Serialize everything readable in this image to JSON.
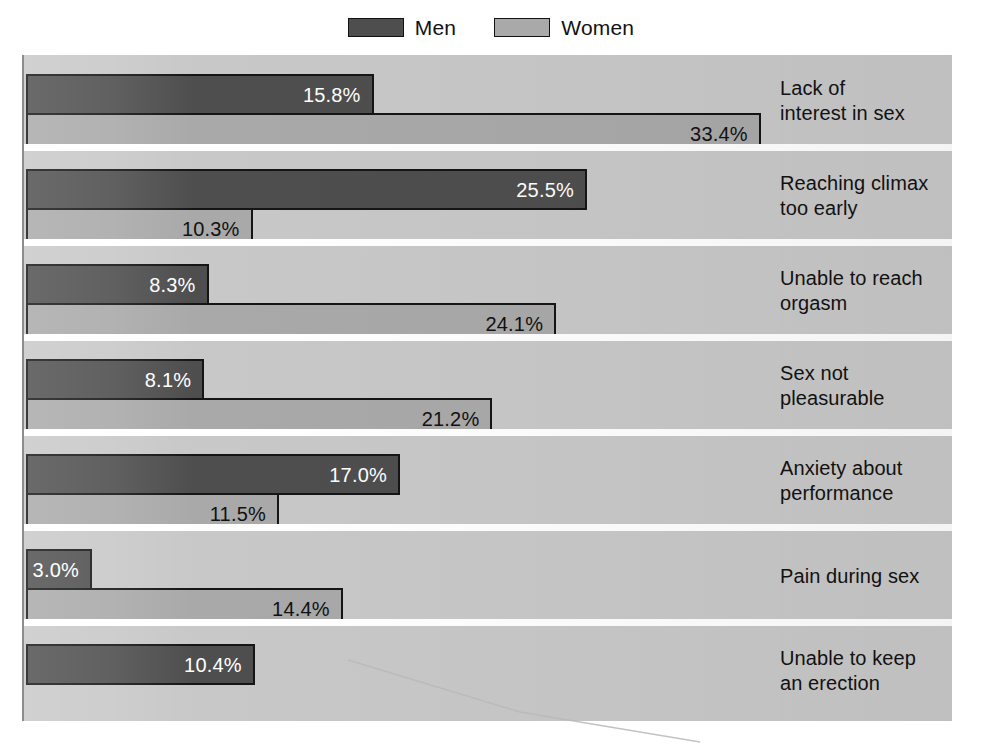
{
  "legend": {
    "entries": [
      {
        "label": "Men",
        "color": "#4e4e4e",
        "icon": "legend-swatch-men"
      },
      {
        "label": "Women",
        "color": "#a9a9a9",
        "icon": "legend-swatch-women"
      }
    ]
  },
  "chart_data": {
    "type": "bar",
    "orientation": "horizontal",
    "title": "",
    "subtitle": "",
    "xlabel": "",
    "ylabel": "",
    "xlim": [
      0,
      42
    ],
    "grid": false,
    "legend_position": "top-center",
    "value_suffix": "%",
    "categories": [
      "Lack of interest in sex",
      "Reaching climax too early",
      "Unable to reach orgasm",
      "Sex not pleasurable",
      "Anxiety about performance",
      "Pain during sex",
      "Unable to keep an erection"
    ],
    "category_lines": [
      [
        "Lack of",
        "interest in sex"
      ],
      [
        "Reaching climax",
        "too early"
      ],
      [
        "Unable to reach",
        "orgasm"
      ],
      [
        "Sex not",
        "pleasurable"
      ],
      [
        "Anxiety about",
        "performance"
      ],
      [
        "Pain during sex"
      ],
      [
        "Unable to keep",
        "an erection"
      ]
    ],
    "series": [
      {
        "name": "Men",
        "color": "#4e4e4e",
        "values": [
          15.8,
          25.5,
          8.3,
          8.1,
          17.0,
          3.0,
          10.4
        ],
        "labels": [
          "15.8%",
          "25.5%",
          "8.3%",
          "8.1%",
          "17.0%",
          "3.0%",
          "10.4%"
        ]
      },
      {
        "name": "Women",
        "color": "#a9a9a9",
        "values": [
          33.4,
          10.3,
          24.1,
          21.2,
          11.5,
          14.4,
          null
        ],
        "labels": [
          "33.4%",
          "10.3%",
          "24.1%",
          "21.2%",
          "11.5%",
          "14.4%",
          null
        ]
      }
    ]
  },
  "colors": {
    "panel_background": "#c8c8c8",
    "men_bar": "#4e4e4e",
    "women_bar": "#a9a9a9",
    "bar_outline": "#151515",
    "separator": "#ffffff",
    "text": "#121212"
  },
  "geometry": {
    "panel_left": 22,
    "panel_top": 55,
    "panel_width": 930,
    "panel_height": 666,
    "bar_origin_x": 2,
    "px_per_percent": 22.0,
    "band_height": 95,
    "bar_height": 41,
    "label_column_left": 756
  }
}
